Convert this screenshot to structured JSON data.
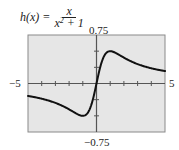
{
  "title": {
    "lhs": "h(x) =",
    "numerator": "x",
    "denominator_base": "x",
    "denominator_exp": "2",
    "denominator_rest": " + 1"
  },
  "labels": {
    "ymax": "0.75",
    "ymin": "−0.75",
    "xmin": "−5",
    "xmax": "5"
  },
  "colors": {
    "plot_background": "#e6e6e6",
    "frame": "#8a8a8a",
    "axis": "#555555",
    "curve": "#111111"
  },
  "chart_data": {
    "type": "line",
    "xlabel": "",
    "ylabel": "",
    "xlim": [
      -5,
      5
    ],
    "ylim": [
      -0.75,
      0.75
    ],
    "x_ticks_step": 1,
    "y_ticks_step": 0.25,
    "grid": false,
    "legend": "none",
    "series": [
      {
        "name": "h(x) = x/(x^2+1)",
        "x": [
          -5,
          -4,
          -3,
          -2,
          -1.5,
          -1,
          -0.5,
          0,
          0.5,
          1,
          1.5,
          2,
          3,
          4,
          5
        ],
        "y": [
          -0.192,
          -0.235,
          -0.3,
          -0.4,
          -0.462,
          -0.5,
          -0.4,
          0,
          0.4,
          0.5,
          0.462,
          0.4,
          0.3,
          0.235,
          0.192
        ]
      }
    ],
    "annotations": [
      "0.75 (ymax)",
      "−0.75 (ymin)",
      "−5 (xmin)",
      "5 (xmax)"
    ]
  }
}
